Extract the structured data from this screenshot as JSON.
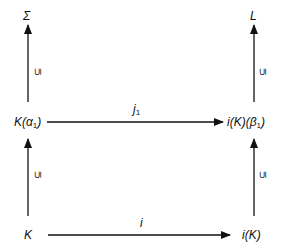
{
  "diagram": {
    "type": "commutative-diagram",
    "nodes": {
      "top_left": {
        "base": "Σ"
      },
      "top_right": {
        "base": "L"
      },
      "mid_left": {
        "prefix": "K(",
        "greek": "α",
        "sub": "1",
        "suffix": ")"
      },
      "mid_right": {
        "prefix": "i(K)(",
        "greek": "β",
        "sub": "1",
        "suffix": ")"
      },
      "bottom_left": {
        "base": "K"
      },
      "bottom_right": {
        "base": "i(K)"
      }
    },
    "edges": {
      "mid_horizontal": {
        "label": "j",
        "sub": "1",
        "from": "K(α1)",
        "to": "i(K)(β1)"
      },
      "bottom_horizontal": {
        "label": "i",
        "from": "K",
        "to": "i(K)"
      },
      "left_upper_vertical": {
        "label": "⊆",
        "from": "K(α1)",
        "to": "Σ"
      },
      "left_lower_vertical": {
        "label": "⊆",
        "from": "K",
        "to": "K(α1)"
      },
      "right_upper_vertical": {
        "label": "⊆",
        "from": "i(K)(β1)",
        "to": "L"
      },
      "right_lower_vertical": {
        "label": "⊆",
        "from": "i(K)",
        "to": "i(K)(β1)"
      }
    },
    "colors": {
      "stroke": "#111111",
      "background": "#ffffff"
    }
  }
}
